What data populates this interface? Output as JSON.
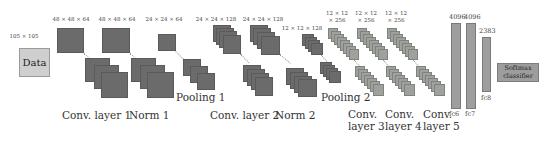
{
  "diagram": {
    "type": "cnn-architecture",
    "input": {
      "label": "Data",
      "size": "105 × 105"
    },
    "layers": [
      {
        "id": "conv1",
        "label": "Conv. layer 1",
        "dims": "48 × 48 × 64"
      },
      {
        "id": "norm1",
        "label": "Norm 1",
        "dims": "48 × 48 × 64"
      },
      {
        "id": "pool1",
        "label": "Pooling 1",
        "dims": "24 × 24 × 64"
      },
      {
        "id": "conv2",
        "label": "Conv. layer 2",
        "dims": "24 × 24 × 128"
      },
      {
        "id": "norm2",
        "label": "Norm 2",
        "dims": "24 × 24 × 128"
      },
      {
        "id": "pool2",
        "label": "Pooling 2",
        "dims": "12 × 12 × 128"
      },
      {
        "id": "conv3",
        "label_line1": "Conv.",
        "label_line2": "layer 3",
        "dims_line1": "12 × 12",
        "dims_line2": "× 256"
      },
      {
        "id": "conv4",
        "label_line1": "Conv.",
        "label_line2": "layer 4",
        "dims_line1": "12 × 12",
        "dims_line2": "× 256"
      },
      {
        "id": "conv5",
        "label_line1": "Conv.",
        "label_line2": "layer 5",
        "dims_line1": "12 × 12",
        "dims_line2": "× 256"
      }
    ],
    "fully_connected": [
      {
        "id": "fc6",
        "label": "fc6",
        "units": "4096"
      },
      {
        "id": "fc7",
        "label": "fc7",
        "units": "4096"
      },
      {
        "id": "fc8",
        "label": "fc8",
        "units": "2383"
      }
    ],
    "output": {
      "line1": "Softmax",
      "line2": "classifier"
    }
  }
}
